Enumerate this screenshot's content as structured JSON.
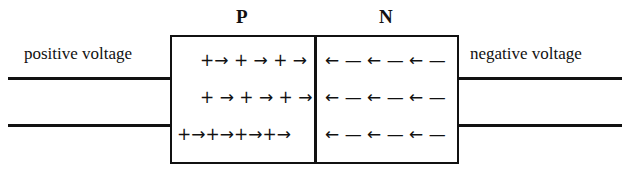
{
  "diagram": {
    "regions": {
      "p_label": "P",
      "n_label": "N"
    },
    "terminals": {
      "left_label": "positive voltage",
      "right_label": "negative voltage"
    },
    "p_region_rows": [
      "+→ + → + →",
      "+ → + → + →",
      "+→+→+→+→"
    ],
    "n_region_rows": [
      "← — ← — ← —",
      "← — ← — ← —",
      "← — ← — ← —"
    ],
    "colors": {
      "line": "#111111",
      "background": "#ffffff"
    }
  }
}
